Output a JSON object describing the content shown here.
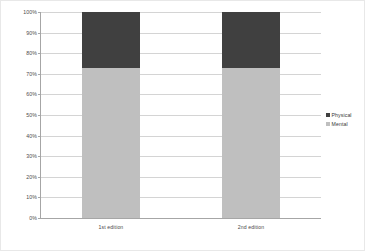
{
  "chart_data": {
    "type": "bar",
    "variant": "stacked-100-percent",
    "title": "",
    "xlabel": "",
    "ylabel": "",
    "categories": [
      "1st edition",
      "2nd edition"
    ],
    "series": [
      {
        "name": "Mental",
        "values": [
          73,
          73
        ],
        "color": "#bfbfbf"
      },
      {
        "name": "Physical",
        "values": [
          27,
          27
        ],
        "color": "#404040"
      }
    ],
    "stack_order_bottom_to_top": [
      "Mental",
      "Physical"
    ],
    "ylim": [
      0,
      100
    ],
    "ytick_values": [
      0,
      10,
      20,
      30,
      40,
      50,
      60,
      70,
      80,
      90,
      100
    ],
    "ytick_labels": [
      "0%",
      "10%",
      "20%",
      "30%",
      "40%",
      "50%",
      "60%",
      "70%",
      "80%",
      "90%",
      "100%"
    ],
    "grid": true,
    "grid_axis": "y",
    "legend": true,
    "legend_position": "right",
    "legend_entries": [
      {
        "label": "Physical",
        "color": "#404040"
      },
      {
        "label": "Mental",
        "color": "#bfbfbf"
      }
    ]
  },
  "colors": {
    "physical": "#404040",
    "mental": "#bfbfbf",
    "gridline": "#d4d4d4",
    "axis": "#a6a6a6",
    "tick_text": "#4a4a4a",
    "frame": "#e8e8e8",
    "background": "#ffffff"
  }
}
